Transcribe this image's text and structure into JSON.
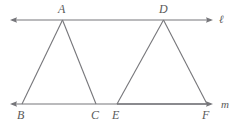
{
  "figure": {
    "kind": "geometry-diagram",
    "stroke_color": "#76767a",
    "emphasis_stroke_color": "#8a8a8e",
    "label_color": "#5a5a5a",
    "background_color": "#ffffff",
    "lines": [
      {
        "name": "line-l",
        "label": "ℓ",
        "label_x": 219,
        "label_y": 14,
        "x1": 10,
        "y1": 20,
        "x2": 213,
        "y2": 20,
        "arrow_start": true,
        "arrow_end": true
      },
      {
        "name": "line-m",
        "label": "m",
        "label_x": 221,
        "label_y": 99,
        "x1": 10,
        "y1": 104,
        "x2": 213,
        "y2": 104,
        "arrow_start": true,
        "arrow_end": true
      }
    ],
    "segments": [
      {
        "name": "segment-AB",
        "x1": 62.5,
        "y1": 20,
        "x2": 22,
        "y2": 104
      },
      {
        "name": "segment-AC",
        "x1": 62.5,
        "y1": 20,
        "x2": 96,
        "y2": 104
      },
      {
        "name": "segment-DE",
        "x1": 163.5,
        "y1": 20,
        "x2": 117,
        "y2": 104
      },
      {
        "name": "segment-DF",
        "x1": 163.5,
        "y1": 20,
        "x2": 207,
        "y2": 104
      },
      {
        "name": "segment-EF",
        "x1": 117,
        "y1": 104,
        "x2": 207,
        "y2": 104
      }
    ],
    "points": [
      {
        "name": "point-A",
        "label": "A",
        "x": 62.5,
        "y": 20,
        "label_x": 58,
        "label_y": 3
      },
      {
        "name": "point-B",
        "label": "B",
        "x": 22,
        "y": 104,
        "label_x": 17,
        "label_y": 109
      },
      {
        "name": "point-C",
        "label": "C",
        "x": 96,
        "y": 104,
        "label_x": 91,
        "label_y": 109
      },
      {
        "name": "point-D",
        "label": "D",
        "x": 163.5,
        "y": 20,
        "label_x": 159,
        "label_y": 3
      },
      {
        "name": "point-E",
        "label": "E",
        "x": 117,
        "y": 104,
        "label_x": 112,
        "label_y": 109
      },
      {
        "name": "point-F",
        "label": "F",
        "x": 207,
        "y": 104,
        "label_x": 202,
        "label_y": 109
      }
    ],
    "triangles": [
      {
        "name": "triangle-ABC",
        "vertices": [
          "A",
          "B",
          "C"
        ]
      },
      {
        "name": "triangle-DEF",
        "vertices": [
          "D",
          "E",
          "F"
        ]
      }
    ]
  }
}
